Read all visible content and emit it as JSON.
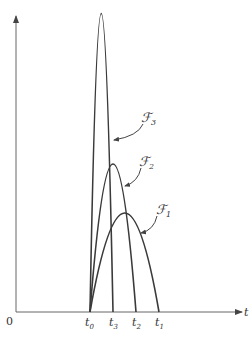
{
  "figure": {
    "axes": {
      "origin_label": "0",
      "x_label": "t",
      "x_ticks": [
        {
          "label": "t",
          "sub": "0",
          "x": 90
        },
        {
          "label": "t",
          "sub": "3",
          "x": 113
        },
        {
          "label": "t",
          "sub": "2",
          "x": 136
        },
        {
          "label": "t",
          "sub": "1",
          "x": 159
        }
      ]
    },
    "curves": [
      {
        "name": "ℱ",
        "sub": "3",
        "start_x": 90,
        "peak": [
          101,
          14
        ],
        "end_x": 113
      },
      {
        "name": "ℱ",
        "sub": "2",
        "start_x": 90,
        "peak": [
          113,
          164
        ],
        "end_x": 136
      },
      {
        "name": "ℱ",
        "sub": "1",
        "start_x": 90,
        "peak": [
          125,
          213
        ],
        "end_x": 159
      }
    ],
    "colors": {
      "line": "#3a3a3a",
      "axis": "#666666",
      "background": "#ffffff"
    }
  }
}
